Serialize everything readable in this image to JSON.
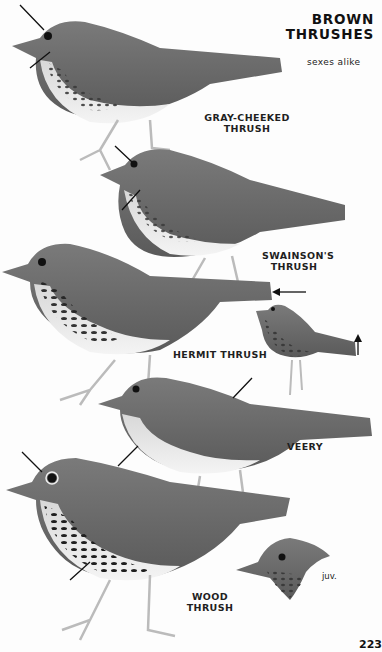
{
  "plate": {
    "title_lines": [
      "BROWN",
      "THRUSHES"
    ],
    "subtitle": "sexes alike",
    "page_number": "223",
    "colors": {
      "background": "#fdfdfd",
      "text": "#1a1a1a",
      "bird_back": "#6e6e6e",
      "bird_belly": "#eeeeee",
      "spots": "#2a2a2a"
    }
  },
  "species": [
    {
      "name_lines": [
        "GRAY-CHEEKED",
        "THRUSH"
      ],
      "pointers": [
        "eye-ring-arrow",
        "cheek-arrow"
      ]
    },
    {
      "name_lines": [
        "SWAINSON'S",
        "THRUSH"
      ],
      "pointers": [
        "eye-ring-arrow",
        "cheek-arrow"
      ]
    },
    {
      "name_lines": [
        "HERMIT THRUSH"
      ],
      "pointers": [
        "tail-arrow",
        "tail-up-arrow"
      ]
    },
    {
      "name_lines": [
        "VEERY"
      ],
      "pointers": [
        "back-arrow",
        "breast-arrow"
      ]
    },
    {
      "name_lines": [
        "WOOD THRUSH"
      ],
      "pointers": [
        "crown-arrow",
        "breast-spots-arrow"
      ],
      "juvenile_label": "juv."
    }
  ]
}
